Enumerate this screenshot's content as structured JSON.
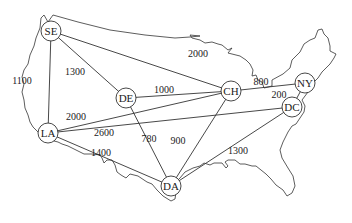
{
  "diagram": {
    "type": "weighted-graph-on-map",
    "background": "US map outline",
    "colors": {
      "line": "#333333",
      "text": "#222222",
      "node_fill": "#ffffff"
    },
    "nodes": [
      {
        "id": "SE",
        "label": "SE",
        "x": 51,
        "y": 31
      },
      {
        "id": "DE",
        "label": "DE",
        "x": 126,
        "y": 98
      },
      {
        "id": "CH",
        "label": "CH",
        "x": 231,
        "y": 91
      },
      {
        "id": "NY",
        "label": "NY",
        "x": 305,
        "y": 83
      },
      {
        "id": "DC",
        "label": "DC",
        "x": 292,
        "y": 107
      },
      {
        "id": "LA",
        "label": "LA",
        "x": 48,
        "y": 133
      },
      {
        "id": "DA",
        "label": "DA",
        "x": 171,
        "y": 186
      }
    ],
    "edges": [
      {
        "from": "SE",
        "to": "CH",
        "weight": "2000",
        "lx": 198,
        "ly": 57
      },
      {
        "from": "SE",
        "to": "DE",
        "weight": "1300",
        "lx": 75,
        "ly": 75
      },
      {
        "from": "SE",
        "to": "LA",
        "weight": "1100",
        "lx": 22,
        "ly": 84
      },
      {
        "from": "DE",
        "to": "CH",
        "weight": "1000",
        "lx": 164,
        "ly": 93
      },
      {
        "from": "LA",
        "to": "CH",
        "weight": "2000",
        "lx": 76,
        "ly": 120
      },
      {
        "from": "LA",
        "to": "DC",
        "weight": "2600",
        "lx": 104,
        "ly": 136
      },
      {
        "from": "LA",
        "to": "DA",
        "weight": "1400",
        "lx": 101,
        "ly": 156
      },
      {
        "from": "DE",
        "to": "DA",
        "weight": "780",
        "lx": 149,
        "ly": 142
      },
      {
        "from": "CH",
        "to": "DA",
        "weight": "900",
        "lx": 178,
        "ly": 144
      },
      {
        "from": "DA",
        "to": "DC",
        "weight": "1300",
        "lx": 238,
        "ly": 154
      },
      {
        "from": "CH",
        "to": "NY",
        "weight": "800",
        "lx": 261,
        "ly": 85
      },
      {
        "from": "NY",
        "to": "DC",
        "weight": "200",
        "lx": 279,
        "ly": 98
      }
    ]
  }
}
